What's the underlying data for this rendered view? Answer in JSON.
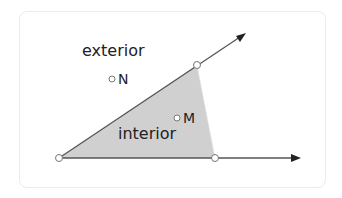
{
  "diagram": {
    "colors": {
      "interior_fill": "#d0d0d0",
      "line": "#555555",
      "arrow": "#222222",
      "point_fill": "#ffffff",
      "point_stroke": "#777777",
      "text": "#222222"
    },
    "vertex": {
      "x": 59,
      "y": 158
    },
    "rays": [
      {
        "name": "upper-ray",
        "from": [
          59,
          158
        ],
        "to": [
          245,
          34
        ]
      },
      {
        "name": "lower-ray",
        "from": [
          59,
          158
        ],
        "to": [
          300,
          158
        ]
      }
    ],
    "interior_region": [
      [
        59,
        158
      ],
      [
        197,
        65
      ],
      [
        215,
        158
      ]
    ],
    "points": [
      {
        "name": "vertex",
        "x": 59,
        "y": 158,
        "label": ""
      },
      {
        "name": "upper-ray-point",
        "x": 197,
        "y": 65,
        "label": ""
      },
      {
        "name": "lower-ray-point",
        "x": 215,
        "y": 158,
        "label": ""
      },
      {
        "name": "N",
        "x": 112,
        "y": 79,
        "label": "N"
      },
      {
        "name": "M",
        "x": 177,
        "y": 118,
        "label": "M"
      }
    ],
    "labels": {
      "exterior": "exterior",
      "interior": "interior",
      "N": "N",
      "M": "M"
    }
  }
}
